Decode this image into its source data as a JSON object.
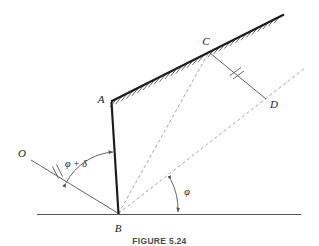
{
  "figure": {
    "caption": "FIGURE 5.24",
    "type": "engineering-geometry-diagram"
  },
  "colors": {
    "line": "#1a1a1a",
    "thin_line": "#555555",
    "dashed_line": "#8a8a8a",
    "hatch": "#3a3a3a",
    "background": "#ffffff",
    "caption": "#4a4a4a"
  },
  "points": [
    {
      "id": "O",
      "label": "O",
      "x": 33,
      "y": 163,
      "label_x": 22,
      "label_y": 153
    },
    {
      "id": "A",
      "label": "A",
      "x": 112,
      "y": 103,
      "label_x": 101,
      "label_y": 100
    },
    {
      "id": "B",
      "label": "B",
      "x": 118,
      "y": 214,
      "label_x": 117,
      "label_y": 230
    },
    {
      "id": "C",
      "label": "C",
      "x": 209,
      "y": 51,
      "label_x": 205,
      "label_y": 44
    },
    {
      "id": "D",
      "label": "D",
      "x": 266,
      "y": 100,
      "label_x": 271,
      "label_y": 106
    }
  ],
  "segments": [
    {
      "name": "wall-AB",
      "from": "A",
      "to": "B",
      "style": "thick-solid"
    },
    {
      "name": "ground-surface-AC",
      "from": "A",
      "to": "C",
      "style": "thick-solid-hatched"
    },
    {
      "name": "ground-surface-beyond-C",
      "from": "C",
      "to": "surface-end",
      "style": "thick-solid-hatched"
    },
    {
      "name": "line-OB",
      "from": "O",
      "to": "B",
      "style": "thin-solid",
      "tick": "double"
    },
    {
      "name": "line-CD",
      "from": "C",
      "to": "D",
      "style": "thin-solid",
      "tick": "double"
    },
    {
      "name": "horizontal-ground-line",
      "from": "left",
      "to": "right",
      "style": "thin-solid"
    },
    {
      "name": "dashed-BC",
      "from": "B",
      "to": "C",
      "style": "dashed"
    },
    {
      "name": "dashed-BD-extended",
      "from": "B",
      "to": "beyond-D",
      "style": "dashed"
    }
  ],
  "angles": [
    {
      "name": "phi-plus-delta",
      "label": "φ + δ",
      "label_x": 76,
      "label_y": 164,
      "vertex": "B",
      "between": [
        "line-OB",
        "wall-AB"
      ]
    },
    {
      "name": "phi",
      "label": "φ",
      "label_x": 185,
      "label_y": 192,
      "vertex": "B",
      "between": [
        "horizontal-ground-line",
        "dashed-BD-extended"
      ]
    }
  ]
}
